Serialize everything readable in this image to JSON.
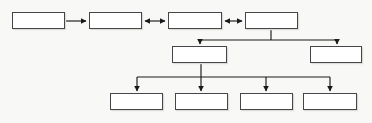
{
  "diagram": {
    "type": "flowchart",
    "orientation": "top-down-with-horizontal-chain",
    "background_color": "#f8f8f6",
    "box_fill_color": "#ffffff",
    "box_border_color": "#46464a",
    "connector_color": "#1a1a1a",
    "canvas": {
      "width": 372,
      "height": 123
    },
    "tiers": [
      {
        "name": "top-row",
        "box_count": 4,
        "nodes": [
          {
            "id": "top-1",
            "label": "",
            "x": 12,
            "y": 12,
            "width": 53,
            "height": 17
          },
          {
            "id": "top-2",
            "label": "",
            "x": 89,
            "y": 12,
            "width": 53,
            "height": 17
          },
          {
            "id": "top-3",
            "label": "",
            "x": 168,
            "y": 12,
            "width": 54,
            "height": 17
          },
          {
            "id": "top-4",
            "label": "",
            "x": 245,
            "y": 12,
            "width": 53,
            "height": 17
          }
        ]
      },
      {
        "name": "middle-row",
        "box_count": 2,
        "nodes": [
          {
            "id": "mid-1",
            "label": "",
            "x": 172,
            "y": 46,
            "width": 55,
            "height": 17
          },
          {
            "id": "mid-2",
            "label": "",
            "x": 310,
            "y": 46,
            "width": 52,
            "height": 17
          }
        ]
      },
      {
        "name": "bottom-row",
        "box_count": 4,
        "nodes": [
          {
            "id": "bot-1",
            "label": "",
            "x": 110,
            "y": 93,
            "width": 53,
            "height": 17
          },
          {
            "id": "bot-2",
            "label": "",
            "x": 175,
            "y": 93,
            "width": 53,
            "height": 17
          },
          {
            "id": "bot-3",
            "label": "",
            "x": 240,
            "y": 93,
            "width": 53,
            "height": 17
          },
          {
            "id": "bot-4",
            "label": "",
            "x": 303,
            "y": 93,
            "width": 54,
            "height": 17
          }
        ]
      }
    ],
    "connectors": [
      {
        "id": "conn-top1-top2",
        "from": "top-1",
        "to": "top-2",
        "style": "single-arrow",
        "direction": "right"
      },
      {
        "id": "conn-top2-top3",
        "from": "top-2",
        "to": "top-3",
        "style": "double-arrow",
        "direction": "bidirectional"
      },
      {
        "id": "conn-top3-top4",
        "from": "top-3",
        "to": "top-4",
        "style": "double-arrow",
        "direction": "bidirectional"
      },
      {
        "id": "conn-top4-mid1",
        "from": "top-4",
        "to": "mid-1",
        "style": "elbow-arrow",
        "direction": "down"
      },
      {
        "id": "conn-top4-mid2",
        "from": "top-4",
        "to": "mid-2",
        "style": "elbow-arrow",
        "direction": "down"
      },
      {
        "id": "conn-mid1-bot1",
        "from": "mid-1",
        "to": "bot-1",
        "style": "elbow-arrow",
        "direction": "down"
      },
      {
        "id": "conn-mid1-bot2",
        "from": "mid-1",
        "to": "bot-2",
        "style": "straight-arrow",
        "direction": "down"
      },
      {
        "id": "conn-mid1-bot3",
        "from": "mid-1",
        "to": "bot-3",
        "style": "elbow-arrow",
        "direction": "down"
      },
      {
        "id": "conn-mid1-bot4",
        "from": "mid-1",
        "to": "bot-4",
        "style": "elbow-arrow",
        "direction": "down"
      }
    ],
    "buses": [
      {
        "id": "upper-bus",
        "y": 40,
        "x_start": 200,
        "x_end": 337,
        "stem_from_x": 271
      },
      {
        "id": "lower-bus",
        "y": 77,
        "x_start": 137,
        "x_end": 330,
        "stem_from_x": 201
      }
    ]
  }
}
